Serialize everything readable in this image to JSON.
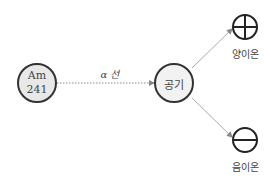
{
  "source": {
    "line1": "Am",
    "line2": "241"
  },
  "beam_label": "α 선",
  "medium": "공기",
  "positive_ion_label": "양이온",
  "negative_ion_label": "음이온",
  "colors": {
    "node_fill": "#e8e8e8",
    "stroke": "#333333",
    "arrow": "#999999"
  }
}
